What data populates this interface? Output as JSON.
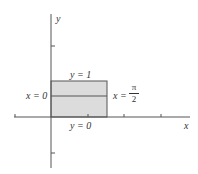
{
  "diagram": {
    "axes": {
      "x_label": "x",
      "y_label": "y"
    },
    "region": {
      "fill": "#d9d9d9",
      "stroke": "#555555",
      "top_label": "y = 1",
      "bottom_label": "y = 0",
      "left_label": "x = 0",
      "right_label_prefix": "x =",
      "right_label_num": "π",
      "right_label_den": "2"
    }
  }
}
